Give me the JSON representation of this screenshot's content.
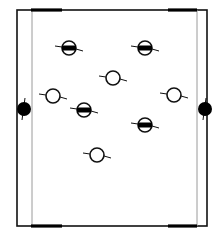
{
  "diagram": {
    "width": 224,
    "height": 237,
    "colors": {
      "line": "#111111",
      "thin_line": "#9a9a9a",
      "fill": "#000000",
      "background": "#ffffff"
    },
    "frame": {
      "left": 17,
      "right": 207,
      "top": 10,
      "bottom": 226
    },
    "inner_lines": [
      {
        "x": 32
      },
      {
        "x": 197
      }
    ],
    "edge_bars": [
      {
        "position": "top-left",
        "x1": 31,
        "x2": 62,
        "y": 10
      },
      {
        "position": "top-right",
        "x1": 168,
        "x2": 197,
        "y": 10
      },
      {
        "position": "bottom-left",
        "x1": 31,
        "x2": 62,
        "y": 226
      },
      {
        "position": "bottom-right",
        "x1": 168,
        "x2": 197,
        "y": 226
      }
    ],
    "side_dots": [
      {
        "side": "left",
        "x": 24,
        "y": 109,
        "r": 7
      },
      {
        "side": "right",
        "x": 205,
        "y": 109,
        "r": 7
      }
    ],
    "markers": [
      {
        "type": "barred",
        "x": 69,
        "y": 48
      },
      {
        "type": "barred",
        "x": 145,
        "y": 48
      },
      {
        "type": "open",
        "x": 113,
        "y": 78
      },
      {
        "type": "open",
        "x": 53,
        "y": 96
      },
      {
        "type": "open",
        "x": 174,
        "y": 95
      },
      {
        "type": "barred",
        "x": 84,
        "y": 110
      },
      {
        "type": "barred",
        "x": 145,
        "y": 125
      },
      {
        "type": "open",
        "x": 97,
        "y": 155
      }
    ]
  }
}
